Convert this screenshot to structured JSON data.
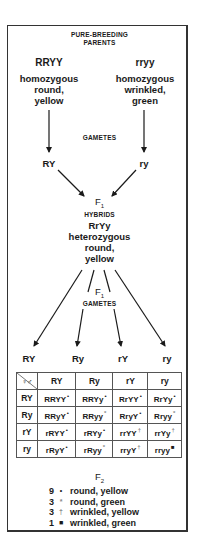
{
  "title_line1": "PURE-BREEDING",
  "title_line2": "PARENTS",
  "parents": [
    {
      "genotype": "RRYY",
      "desc_lines": [
        "homozygous",
        "round,",
        "yellow"
      ]
    },
    {
      "genotype": "rryy",
      "desc_lines": [
        "homozygous",
        "wrinkled,",
        "green"
      ]
    }
  ],
  "gametes_label": "GAMETES",
  "parent_gametes": [
    "RY",
    "ry"
  ],
  "f1": {
    "label": "F",
    "sub": "1",
    "hybrids_label": "HYBRIDS",
    "genotype": "RrYy",
    "desc_lines": [
      "heterozygous",
      "round,",
      "yellow"
    ]
  },
  "f1_gametes_label": {
    "label": "F",
    "sub": "1",
    "text": "GAMETES"
  },
  "f1_gametes": [
    "RY",
    "Ry",
    "rY",
    "ry"
  ],
  "punnett": {
    "corner": "♀♂",
    "col_headers": [
      "RY",
      "Ry",
      "rY",
      "ry"
    ],
    "rows": [
      {
        "header": "RY",
        "cells": [
          {
            "g": "RRYY",
            "m": "•"
          },
          {
            "g": "RRYy",
            "m": "•"
          },
          {
            "g": "RrYY",
            "m": "•"
          },
          {
            "g": "RrYy",
            "m": "•"
          }
        ]
      },
      {
        "header": "Ry",
        "cells": [
          {
            "g": "RRyY",
            "m": "•"
          },
          {
            "g": "RRyy",
            "m": "*"
          },
          {
            "g": "RryY",
            "m": "•"
          },
          {
            "g": "Rryy",
            "m": "*"
          }
        ]
      },
      {
        "header": "rY",
        "cells": [
          {
            "g": "rRYY",
            "m": "•"
          },
          {
            "g": "rRYy",
            "m": "•"
          },
          {
            "g": "rrYY",
            "m": "†"
          },
          {
            "g": "rrYy",
            "m": "†"
          }
        ]
      },
      {
        "header": "ry",
        "cells": [
          {
            "g": "rRyY",
            "m": "•"
          },
          {
            "g": "rRyy",
            "m": "*"
          },
          {
            "g": "rryY",
            "m": "†"
          },
          {
            "g": "rryy",
            "m": "■"
          }
        ]
      }
    ]
  },
  "f2": {
    "label": "F",
    "sub": "2",
    "legend": [
      {
        "count": "9",
        "symbol": "•",
        "text": "round, yellow"
      },
      {
        "count": "3",
        "symbol": "*",
        "text": "round, green"
      },
      {
        "count": "3",
        "symbol": "†",
        "text": "wrinkled, yellow"
      },
      {
        "count": "1",
        "symbol": "■",
        "text": "wrinkled, green"
      }
    ]
  },
  "colors": {
    "ink": "#1a1a1a",
    "border": "#333333",
    "grid": "#555555",
    "marker_light": "#888888"
  }
}
